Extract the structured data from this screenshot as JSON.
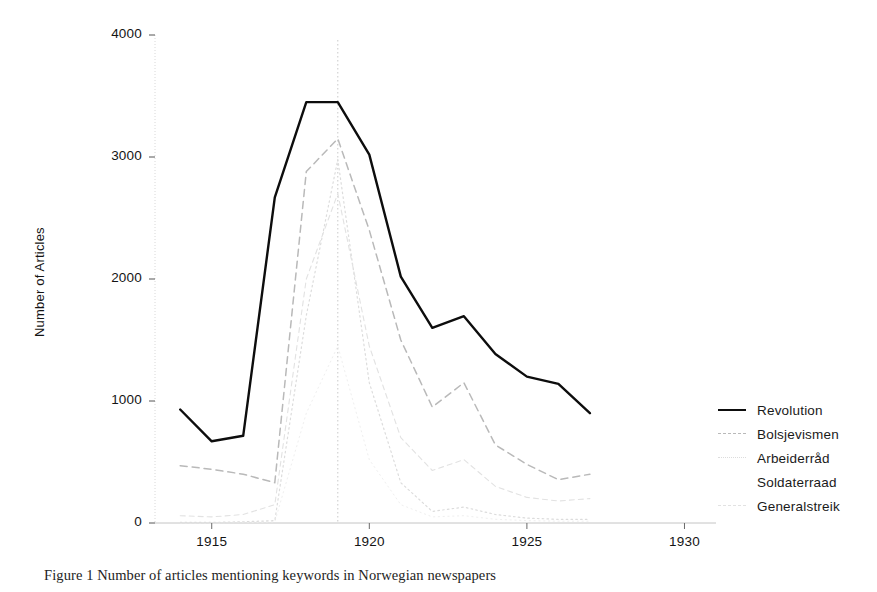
{
  "figure": {
    "background": "#ffffff",
    "caption": "Figure 1 Number of articles mentioning keywords in Norwegian newspapers",
    "caption_visible_fragment": "Figure 1 Number of articles ..."
  },
  "axes": {
    "ylabel": "Number of Articles",
    "ytick_labels": [
      "0",
      "1000",
      "2000",
      "3000",
      "4000"
    ],
    "xtick_labels": [
      "1915",
      "1920",
      "1925",
      "1930"
    ],
    "ylim": [
      0,
      4000
    ],
    "xlim": [
      1913.2,
      1931.0
    ]
  },
  "legend": {
    "position": "right",
    "entries": [
      {
        "label": "Revolution",
        "style": "solid",
        "color": "#0d0d0d",
        "width": 2.4
      },
      {
        "label": "Bolsjevismen",
        "style": "dashed",
        "color": "#b9b9b9",
        "width": 1.5
      },
      {
        "label": "Arbeiderråd",
        "style": "dotted",
        "color": "#dcdcdc",
        "width": 1.2
      },
      {
        "label": "Soldaterraad",
        "style": "none",
        "color": "#efefef",
        "width": 1.0
      },
      {
        "label": "Generalstreik",
        "style": "dashed-thin",
        "color": "#e2e2e2",
        "width": 1.1
      }
    ]
  },
  "reference_line": {
    "x": 1919,
    "style": "dotted",
    "color": "#c9c9c9"
  },
  "chart_data": {
    "type": "line",
    "title": "",
    "xlabel": "",
    "ylabel": "Number of Articles",
    "xlim": [
      1913.2,
      1931.0
    ],
    "ylim": [
      0,
      4000
    ],
    "xticks": [
      1915,
      1920,
      1925,
      1930
    ],
    "yticks": [
      0,
      1000,
      2000,
      3000,
      4000
    ],
    "grid": false,
    "legend_position": "right",
    "annotations": [
      {
        "type": "vline",
        "x": 1919,
        "label": ""
      }
    ],
    "x": [
      1914,
      1915,
      1916,
      1917,
      1918,
      1919,
      1920,
      1921,
      1922,
      1923,
      1924,
      1925,
      1926,
      1927
    ],
    "series": [
      {
        "name": "Revolution",
        "style": "solid",
        "color": "#0d0d0d",
        "values": [
          930,
          670,
          715,
          2670,
          3450,
          3450,
          3020,
          2020,
          1600,
          1695,
          1385,
          1200,
          1140,
          900
        ]
      },
      {
        "name": "Bolsjevismen",
        "style": "dashed",
        "color": "#b9b9b9",
        "values": [
          470,
          440,
          400,
          330,
          2880,
          3150,
          2400,
          1500,
          950,
          1150,
          640,
          480,
          355,
          400
        ]
      },
      {
        "name": "Arbeiderråd",
        "style": "dotted",
        "color": "#dcdcdc",
        "values": [
          5,
          5,
          10,
          20,
          1700,
          2980,
          1150,
          330,
          95,
          130,
          70,
          40,
          30,
          30
        ]
      },
      {
        "name": "Soldaterraad",
        "style": "faint",
        "color": "#efefef",
        "values": [
          2,
          2,
          4,
          10,
          900,
          1450,
          520,
          150,
          50,
          60,
          30,
          20,
          15,
          15
        ]
      },
      {
        "name": "Generalstreik",
        "style": "dashed-thin",
        "color": "#e2e2e2",
        "values": [
          60,
          50,
          70,
          150,
          2000,
          2700,
          1450,
          700,
          430,
          520,
          300,
          210,
          180,
          200
        ]
      }
    ]
  }
}
